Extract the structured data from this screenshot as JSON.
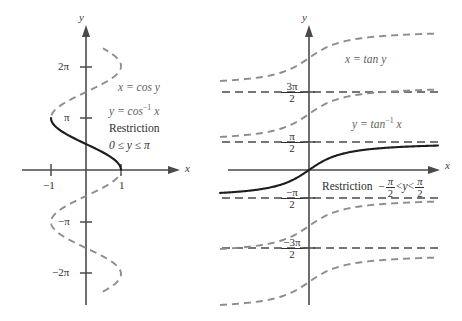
{
  "figure": {
    "background_color": "#ffffff",
    "ghost_curve_color": "#8d8d8d",
    "main_curve_color": "#1d1d1d",
    "axis_color": "#4a4a4a"
  },
  "left_panel": {
    "name": "arccosine-graph",
    "origin": {
      "x": 86,
      "y": 170
    },
    "axis_labels": {
      "x": "x",
      "y": "y"
    },
    "y_ticks": [
      {
        "label": "2π",
        "value": 6.2832,
        "py": 67
      },
      {
        "label": "π",
        "value": 3.1416,
        "py": 118
      },
      {
        "label": "−π",
        "value": -3.1416,
        "py": 222
      },
      {
        "label": "−2π",
        "value": -6.2832,
        "py": 273
      }
    ],
    "x_ticks": [
      {
        "label": "−1",
        "value": -1,
        "px": 51
      },
      {
        "label": "1",
        "value": 1,
        "px": 121
      }
    ],
    "annotations": {
      "relation": "x = cos y",
      "inverse_lead": "y = cos",
      "inverse_exp": "−1",
      "inverse_tail": "x",
      "restriction_word": "Restriction",
      "restriction_range": "0 ≤ y ≤ π"
    }
  },
  "right_panel": {
    "name": "arctangent-graph",
    "origin": {
      "x": 309,
      "y": 170
    },
    "axis_labels": {
      "x": "x",
      "y": "y"
    },
    "y_ticks": [
      {
        "num": "3π",
        "den": "2",
        "sign": "",
        "value": 4.7124,
        "py": 92
      },
      {
        "num": "π",
        "den": "2",
        "sign": "",
        "value": 1.5708,
        "py": 142
      },
      {
        "num": "π",
        "den": "2",
        "sign": "−",
        "value": -1.5708,
        "py": 198
      },
      {
        "num": "3π",
        "den": "2",
        "sign": "−",
        "value": -4.7124,
        "py": 248
      }
    ],
    "annotations": {
      "relation": "x = tan y",
      "inverse_lead": "y = tan",
      "inverse_exp": "−1",
      "inverse_tail": "x",
      "restriction_word": "Restriction",
      "restriction_lt1": "<",
      "restriction_var": "y",
      "restriction_lt2": "<",
      "restriction_neg": "−",
      "frac_num": "π",
      "frac_den": "2"
    }
  },
  "chart_data": {
    "type": "line",
    "panels": [
      {
        "id": "arccos",
        "title": "x = cos y  /  y = cos⁻¹ x",
        "xlabel": "x",
        "ylabel": "y",
        "xlim": [
          -2.0,
          2.0
        ],
        "ylim": [
          -7.6,
          8.2
        ],
        "grid": false,
        "x_tick_labels": [
          "−1",
          "1"
        ],
        "x_tick_values": [
          -1,
          1
        ],
        "y_tick_labels": [
          "2π",
          "π",
          "−π",
          "−2π"
        ],
        "y_tick_values": [
          6.2832,
          3.1416,
          -3.1416,
          -6.2832
        ],
        "series": [
          {
            "name": "x = cos y (full relation)",
            "style": "dashed",
            "color": "#8d8d8d",
            "description": "sideways cosine curve, y from -7.3 to 7.3, x = cos y",
            "y_range": [
              -7.3,
              7.3
            ]
          },
          {
            "name": "y = cos⁻¹ x (principal branch)",
            "style": "solid",
            "color": "#1d1d1d",
            "description": "restricted branch for 0 ≤ y ≤ π",
            "y_range": [
              0,
              3.1416
            ]
          }
        ],
        "annotations": [
          "x = cos y",
          "y = cos⁻¹ x",
          "Restriction",
          "0 ≤ y ≤ π"
        ]
      },
      {
        "id": "arctan",
        "title": "x = tan y  /  y = tan⁻¹ x",
        "xlabel": "x",
        "ylabel": "y",
        "xlim": [
          -2.6,
          5.0
        ],
        "ylim": [
          -7.6,
          8.2
        ],
        "grid": false,
        "y_tick_labels": [
          "3π/2",
          "π/2",
          "−π/2",
          "−3π/2"
        ],
        "y_tick_values": [
          4.7124,
          1.5708,
          -1.5708,
          -4.7124
        ],
        "asymptotes": [
          4.7124,
          1.5708,
          -1.5708,
          -4.7124
        ],
        "series": [
          {
            "name": "x = tan y (full relation)",
            "style": "dashed",
            "color": "#8d8d8d",
            "description": "repeated arctan branches offset by π",
            "branches": [
              -2,
              -1,
              1,
              2
            ]
          },
          {
            "name": "y = tan⁻¹ x (principal branch)",
            "style": "solid",
            "color": "#1d1d1d",
            "description": "restricted branch for −π/2 < y < π/2",
            "y_range": [
              -1.5708,
              1.5708
            ]
          }
        ],
        "annotations": [
          "x = tan y",
          "y = tan⁻¹ x",
          "Restriction  −π/2 < y < π/2"
        ]
      }
    ]
  }
}
